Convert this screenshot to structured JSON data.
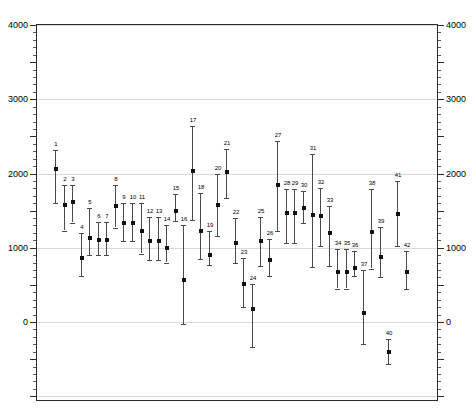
{
  "chart_data": {
    "type": "scatter",
    "title": "",
    "xlabel": "",
    "ylabel": "",
    "ylim": [
      -1400,
      4000
    ],
    "y_ticks_major": [
      0,
      1000,
      2000,
      3000,
      4000
    ],
    "y_tick_labels": [
      "0",
      "1000",
      "2000",
      "3000",
      "4000"
    ],
    "y_axis_left_labels": [
      "4000",
      "3000",
      "2000",
      "1000",
      "0"
    ],
    "y_axis_right_labels": [
      "4000",
      "3000",
      "2000",
      "1000",
      "0"
    ],
    "grid": true,
    "grid_lines_at": [
      0,
      1000,
      2000,
      3000,
      4000
    ],
    "minor_tick_interval": 100,
    "x_axis_visible": false,
    "legend": "none",
    "error_bar_style": "vertical-line-with-caps",
    "marker_style": "filled-square",
    "point_labels_position": "above-upper-cap",
    "points": [
      {
        "label": "1",
        "x": 1,
        "y": 2060,
        "low": 1600,
        "high": 2320
      },
      {
        "label": "2",
        "x": 2,
        "y": 1570,
        "low": 1230,
        "high": 1840
      },
      {
        "label": "3",
        "x": 3,
        "y": 1620,
        "low": 1340,
        "high": 1840
      },
      {
        "label": "4",
        "x": 4,
        "y": 860,
        "low": 620,
        "high": 1200
      },
      {
        "label": "5",
        "x": 5,
        "y": 1130,
        "low": 900,
        "high": 1530
      },
      {
        "label": "6",
        "x": 6,
        "y": 1100,
        "low": 900,
        "high": 1350
      },
      {
        "label": "7",
        "x": 7,
        "y": 1100,
        "low": 900,
        "high": 1350
      },
      {
        "label": "8",
        "x": 8,
        "y": 1560,
        "low": 1270,
        "high": 1840
      },
      {
        "label": "9",
        "x": 9,
        "y": 1340,
        "low": 1090,
        "high": 1600
      },
      {
        "label": "10",
        "x": 10,
        "y": 1340,
        "low": 1090,
        "high": 1600
      },
      {
        "label": "11",
        "x": 11,
        "y": 1230,
        "low": 920,
        "high": 1600
      },
      {
        "label": "12",
        "x": 12,
        "y": 1090,
        "low": 830,
        "high": 1420
      },
      {
        "label": "13",
        "x": 13,
        "y": 1090,
        "low": 830,
        "high": 1420
      },
      {
        "label": "14",
        "x": 14,
        "y": 990,
        "low": 800,
        "high": 1300
      },
      {
        "label": "15",
        "x": 15,
        "y": 1500,
        "low": 1360,
        "high": 1720
      },
      {
        "label": "16",
        "x": 16,
        "y": 560,
        "low": -30,
        "high": 1300
      },
      {
        "label": "17",
        "x": 17,
        "y": 2030,
        "low": 1380,
        "high": 2640
      },
      {
        "label": "18",
        "x": 18,
        "y": 1230,
        "low": 850,
        "high": 1740
      },
      {
        "label": "19",
        "x": 19,
        "y": 900,
        "low": 770,
        "high": 1230
      },
      {
        "label": "20",
        "x": 20,
        "y": 1570,
        "low": 1160,
        "high": 2000
      },
      {
        "label": "21",
        "x": 21,
        "y": 2020,
        "low": 1670,
        "high": 2330
      },
      {
        "label": "22",
        "x": 22,
        "y": 1060,
        "low": 790,
        "high": 1400
      },
      {
        "label": "23",
        "x": 23,
        "y": 510,
        "low": 200,
        "high": 860
      },
      {
        "label": "24",
        "x": 24,
        "y": 180,
        "low": -340,
        "high": 510
      },
      {
        "label": "25",
        "x": 25,
        "y": 1090,
        "low": 760,
        "high": 1420
      },
      {
        "label": "26",
        "x": 26,
        "y": 830,
        "low": 620,
        "high": 1120
      },
      {
        "label": "27",
        "x": 27,
        "y": 1850,
        "low": 1230,
        "high": 2440
      },
      {
        "label": "28",
        "x": 28,
        "y": 1470,
        "low": 1060,
        "high": 1790
      },
      {
        "label": "29",
        "x": 29,
        "y": 1470,
        "low": 1060,
        "high": 1790
      },
      {
        "label": "30",
        "x": 30,
        "y": 1540,
        "low": 1330,
        "high": 1760
      },
      {
        "label": "31",
        "x": 31,
        "y": 1440,
        "low": 740,
        "high": 2260
      },
      {
        "label": "32",
        "x": 32,
        "y": 1430,
        "low": 1020,
        "high": 1800
      },
      {
        "label": "33",
        "x": 33,
        "y": 1200,
        "low": 750,
        "high": 1560
      },
      {
        "label": "34",
        "x": 34,
        "y": 670,
        "low": 450,
        "high": 980
      },
      {
        "label": "35",
        "x": 35,
        "y": 670,
        "low": 450,
        "high": 980
      },
      {
        "label": "36",
        "x": 36,
        "y": 730,
        "low": 620,
        "high": 950
      },
      {
        "label": "37",
        "x": 37,
        "y": 120,
        "low": -300,
        "high": 700
      },
      {
        "label": "38",
        "x": 38,
        "y": 1210,
        "low": 720,
        "high": 1790
      },
      {
        "label": "39",
        "x": 39,
        "y": 880,
        "low": 600,
        "high": 1280
      },
      {
        "label": "40",
        "x": 40,
        "y": -400,
        "low": -560,
        "high": -230
      },
      {
        "label": "41",
        "x": 41,
        "y": 1460,
        "low": 1020,
        "high": 1900
      },
      {
        "label": "42",
        "x": 42,
        "y": 680,
        "low": 440,
        "high": 960
      }
    ]
  },
  "colors": {
    "grid": "#d9d9d9",
    "axis": "#2b2b2b",
    "marker": "#111111",
    "errorbar": "#4a4a4a",
    "background": "#ffffff"
  }
}
